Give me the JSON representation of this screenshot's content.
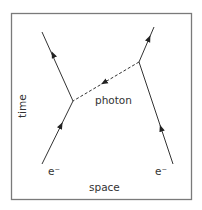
{
  "diagram": {
    "type": "feynman-diagram",
    "frame": {
      "x": 11,
      "y": 13,
      "width": 181,
      "height": 187,
      "stroke": "#7a7a7a"
    },
    "line_color": "#333333",
    "axes": {
      "vertical_label": "time",
      "horizontal_label": "space"
    },
    "vertices": [
      {
        "id": "left-vertex",
        "x": 73,
        "y": 101
      },
      {
        "id": "right-vertex",
        "x": 139,
        "y": 62
      }
    ],
    "particles": [
      {
        "id": "electron-left-in",
        "label": "e⁻",
        "from": [
          42,
          164
        ],
        "to": [
          73,
          101
        ],
        "arrow_at": [
          60,
          128
        ]
      },
      {
        "id": "electron-left-out",
        "label": "",
        "from": [
          73,
          101
        ],
        "to": [
          42,
          32
        ],
        "arrow_at": [
          54,
          58
        ]
      },
      {
        "id": "electron-right-in",
        "label": "e⁻",
        "from": [
          173,
          164
        ],
        "to": [
          139,
          62
        ],
        "arrow_at": [
          162,
          128
        ]
      },
      {
        "id": "electron-right-out",
        "label": "",
        "from": [
          139,
          62
        ],
        "to": [
          154,
          27
        ],
        "arrow_at": [
          148,
          40
        ]
      },
      {
        "id": "photon",
        "label": "photon",
        "from": [
          139,
          62
        ],
        "to": [
          73,
          101
        ],
        "arrow_at": [
          106,
          81
        ],
        "style": "dashed"
      }
    ],
    "labels": {
      "photon": "photon",
      "electron_left": "e⁻",
      "electron_right": "e⁻",
      "time": "time",
      "space": "space"
    }
  }
}
